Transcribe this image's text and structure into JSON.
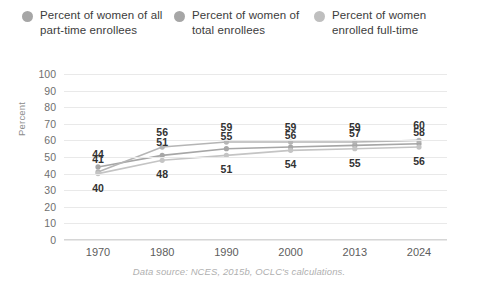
{
  "legend": {
    "items": [
      {
        "label": "Percent of women of all part-time enrollees",
        "color": "#a6a6a6",
        "dot": "legend-dot"
      },
      {
        "label": "Percent of women of total enrollees",
        "color": "#a6a6a6",
        "dot": "legend-dot"
      },
      {
        "label": "Percent of women enrolled full-time",
        "color": "#bfbfbf",
        "dot": "legend-dot"
      }
    ]
  },
  "source": "Data source: NCES, 2015b, OCLC's calculations.",
  "chart_data": {
    "type": "line",
    "title": "",
    "subtitle": "",
    "xlabel": "",
    "ylabel": "Percent",
    "categories": [
      "1970",
      "1980",
      "1990",
      "2000",
      "2013",
      "2024"
    ],
    "ylim": [
      0,
      100
    ],
    "yticks": [
      0,
      10,
      20,
      30,
      40,
      50,
      60,
      70,
      80,
      90,
      100
    ],
    "grid": true,
    "legend_position": "top",
    "series": [
      {
        "name": "Percent of women of all part-time enrollees",
        "color": "#a6a6a6",
        "values": [
          44,
          51,
          55,
          56,
          57,
          58
        ],
        "labels": [
          "44",
          "51",
          "55",
          "56",
          "57",
          "58"
        ]
      },
      {
        "name": "Percent of women of total enrollees",
        "color": "#b5b5b5",
        "values": [
          41,
          56,
          59,
          59,
          59,
          60
        ],
        "labels": [
          "41",
          "56",
          "59",
          "59",
          "59",
          "60"
        ]
      },
      {
        "name": "Percent of women enrolled full-time",
        "color": "#c4c4c4",
        "values": [
          40,
          48,
          51,
          54,
          55,
          56
        ],
        "labels": [
          "40",
          "48",
          "51",
          "54",
          "55",
          "56"
        ]
      }
    ]
  }
}
